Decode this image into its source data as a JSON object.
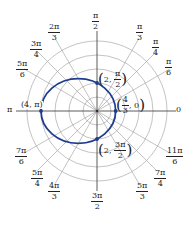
{
  "figure": {
    "type": "polar-graph",
    "equation_implied": "r = 2 / (1 + 0.5 cos θ)",
    "curve_color": "#1f3c8f",
    "grid_color": "#9a9a9a",
    "axis_color": "#333333",
    "rings": [
      1,
      2,
      3,
      4,
      5
    ],
    "angle_labels": [
      {
        "key": "a0",
        "num": "0",
        "den": ""
      },
      {
        "key": "a30",
        "num": "π",
        "den": "6"
      },
      {
        "key": "a45",
        "num": "π",
        "den": "4"
      },
      {
        "key": "a60",
        "num": "π",
        "den": "3"
      },
      {
        "key": "a90",
        "num": "π",
        "den": "2"
      },
      {
        "key": "a120",
        "num": "2π",
        "den": "3"
      },
      {
        "key": "a135",
        "num": "3π",
        "den": "4"
      },
      {
        "key": "a150",
        "num": "5π",
        "den": "6"
      },
      {
        "key": "a180",
        "num": "π",
        "den": ""
      },
      {
        "key": "a210",
        "num": "7π",
        "den": "6"
      },
      {
        "key": "a225",
        "num": "5π",
        "den": "4"
      },
      {
        "key": "a240",
        "num": "4π",
        "den": "3"
      },
      {
        "key": "a270",
        "num": "3π",
        "den": "2"
      },
      {
        "key": "a300",
        "num": "5π",
        "den": "3"
      },
      {
        "key": "a315",
        "num": "7π",
        "den": "4"
      },
      {
        "key": "a330",
        "num": "11π",
        "den": "6"
      }
    ],
    "points": [
      {
        "label_r": "2",
        "label_theta_num": "π",
        "label_theta_den": "2"
      },
      {
        "label_r_num": "4",
        "label_r_den": "3",
        "label_theta": "0"
      },
      {
        "label": "(4, π)"
      },
      {
        "label_r": "2",
        "label_theta_num": "3π",
        "label_theta_den": "2"
      }
    ]
  }
}
